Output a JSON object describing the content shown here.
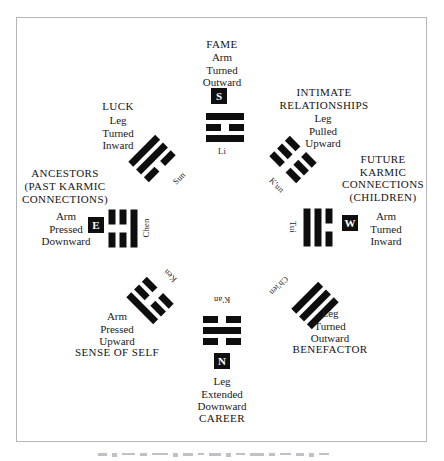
{
  "figure": {
    "background": "#ffffff",
    "frame_color": "#b5b5b5",
    "ink_color": "#0e0e0e",
    "direction_box_bg": "#0f0f0f",
    "direction_box_fg": "#ffffff"
  },
  "sectors": {
    "top": {
      "area": [
        "FAME"
      ],
      "body": [
        "Arm",
        "Turned",
        "Outward"
      ],
      "direction_letter": "S",
      "trigram": {
        "name": "Li",
        "lines": [
          "solid",
          "broken",
          "solid"
        ],
        "rotation": 0
      }
    },
    "top_right": {
      "area": [
        "INTIMATE",
        "RELATIONSHIPS"
      ],
      "body": [
        "Leg",
        "Pulled",
        "Upward"
      ],
      "trigram": {
        "name": "K'un",
        "lines": [
          "broken",
          "broken",
          "broken"
        ],
        "rotation": 45
      }
    },
    "right": {
      "area": [
        "FUTURE",
        "KARMIC",
        "CONNECTIONS",
        "(CHILDREN)"
      ],
      "body": [
        "Arm",
        "Turned",
        "Inward"
      ],
      "direction_letter": "W",
      "trigram": {
        "name": "Tui",
        "lines": [
          "broken",
          "solid",
          "solid"
        ],
        "rotation": 90
      }
    },
    "bottom_right": {
      "area": [
        "BENEFACTOR"
      ],
      "body": [
        "Leg",
        "Turned",
        "Outward"
      ],
      "trigram": {
        "name": "Ch'ien",
        "lines": [
          "solid",
          "solid",
          "solid"
        ],
        "rotation": 135
      }
    },
    "bottom": {
      "area": [
        "CAREER"
      ],
      "body": [
        "Leg",
        "Extended",
        "Downward"
      ],
      "direction_letter": "N",
      "trigram": {
        "name": "K'an",
        "lines": [
          "broken",
          "solid",
          "broken"
        ],
        "rotation": 180
      }
    },
    "bottom_left": {
      "area": [
        "SENSE OF SELF"
      ],
      "body": [
        "Arm",
        "Pressed",
        "Upward"
      ],
      "trigram": {
        "name": "Ken",
        "lines": [
          "solid",
          "broken",
          "broken"
        ],
        "rotation": 225
      }
    },
    "left": {
      "area": [
        "ANCESTORS",
        "(PAST KARMIC",
        "CONNECTIONS)"
      ],
      "body": [
        "Arm",
        "Pressed",
        "Downward"
      ],
      "direction_letter": "E",
      "trigram": {
        "name": "Chen",
        "lines": [
          "broken",
          "broken",
          "solid"
        ],
        "rotation": 270
      }
    },
    "top_left": {
      "area": [
        "LUCK"
      ],
      "body": [
        "Leg",
        "Turned",
        "Inward"
      ],
      "trigram": {
        "name": "Sun",
        "lines": [
          "solid",
          "solid",
          "broken"
        ],
        "rotation": 315
      }
    }
  }
}
